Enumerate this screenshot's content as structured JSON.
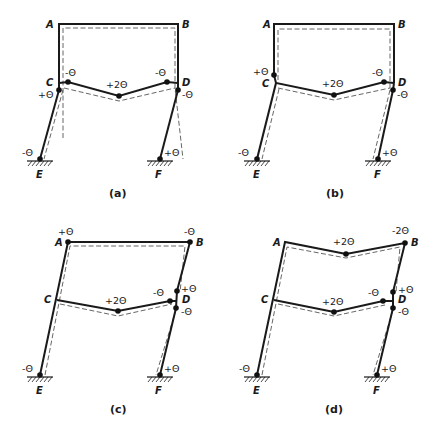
{
  "figure": {
    "theta": "Θ",
    "panels": [
      {
        "caption": "(a)",
        "nodes": {
          "A": "A",
          "B": "B",
          "C": "C",
          "D": "D",
          "E": "E",
          "F": "F"
        },
        "rotations": {
          "beam_left": "-Θ",
          "beam_mid": "+2Θ",
          "beam_right": "-Θ",
          "col_top_left": "+Θ",
          "col_top_right": "-Θ",
          "base_left": "-Θ",
          "base_right": "+Θ"
        }
      },
      {
        "caption": "(b)",
        "nodes": {
          "A": "A",
          "B": "B",
          "C": "C",
          "D": "D",
          "E": "E",
          "F": "F"
        },
        "rotations": {
          "col_upper_left": "+Θ",
          "beam_mid": "+2Θ",
          "beam_right": "-Θ",
          "col_top_right": "-Θ",
          "base_left": "-Θ",
          "base_right": "+Θ"
        }
      },
      {
        "caption": "(c)",
        "nodes": {
          "A": "A",
          "B": "B",
          "C": "C",
          "D": "D",
          "E": "E",
          "F": "F"
        },
        "rotations": {
          "top_left": "+Θ",
          "top_right": "-Θ",
          "upper_right_col": "+Θ",
          "beam_mid": "+2Θ",
          "beam_right": "-Θ",
          "lower_right_col": "-Θ",
          "base_left": "-Θ",
          "base_right": "+Θ"
        }
      },
      {
        "caption": "(d)",
        "nodes": {
          "A": "A",
          "B": "B",
          "C": "C",
          "D": "D",
          "E": "E",
          "F": "F"
        },
        "rotations": {
          "top_mid": "+2Θ",
          "top_right": "-2Θ",
          "upper_right_col": "+Θ",
          "beam_mid": "+2Θ",
          "beam_right": "-Θ",
          "lower_right_col": "-Θ",
          "base_left": "-Θ",
          "base_right": "+Θ"
        }
      }
    ]
  }
}
